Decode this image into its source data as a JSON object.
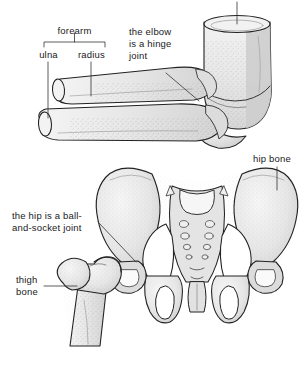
{
  "figure": {
    "background_color": "#ffffff",
    "ink_color": "#1a1a1a",
    "bone_fill_color": "#e9e9e9",
    "bone_shade_color": "#d2d2d2",
    "outline_color": "#222222"
  },
  "labels": {
    "humerus": "humerus",
    "forearm": "forearm",
    "ulna": "ulna",
    "radius": "radius",
    "elbow_note_line1": "the elbow",
    "elbow_note_line2": "is a hinge",
    "elbow_note_line3": "joint",
    "hip_bone": "hip bone",
    "hip_note_line1": "the hip is a ball-",
    "hip_note_line2": "and-socket joint",
    "thigh_line1": "thigh",
    "thigh_line2": "bone"
  },
  "structures": [
    {
      "name": "humerus",
      "region": "upper-arm",
      "joint": "elbow"
    },
    {
      "name": "radius",
      "region": "forearm",
      "joint": "elbow"
    },
    {
      "name": "ulna",
      "region": "forearm",
      "joint": "elbow"
    },
    {
      "name": "hip bone",
      "region": "pelvis",
      "joint": "hip"
    },
    {
      "name": "sacrum",
      "region": "pelvis",
      "joint": "hip"
    },
    {
      "name": "thigh bone",
      "region": "leg",
      "joint": "hip"
    }
  ],
  "joints": [
    {
      "name": "elbow",
      "type": "hinge"
    },
    {
      "name": "hip",
      "type": "ball-and-socket"
    }
  ]
}
